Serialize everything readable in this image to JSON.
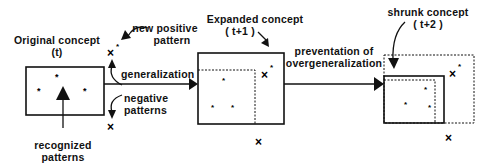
{
  "diagram": {
    "stages": [
      {
        "name": "original",
        "title": "Original concept",
        "time": "(t)"
      },
      {
        "name": "expanded",
        "title": "Expanded concept",
        "time": "( t+1 )"
      },
      {
        "name": "shrunk",
        "title": "shrunk concept",
        "time": "( t+2 )"
      }
    ],
    "transitions": [
      {
        "label": "generalization"
      },
      {
        "label_line1": "preventation of",
        "label_line2": "overgeneralization"
      }
    ],
    "annotations": {
      "new_positive_line1": "new positive",
      "new_positive_line2": "pattern",
      "negative_line1": "negative",
      "negative_line2": "patterns",
      "recognized_line1": "recognized",
      "recognized_line2": "patterns"
    },
    "symbols": {
      "positive": "*",
      "negative": "×"
    }
  }
}
